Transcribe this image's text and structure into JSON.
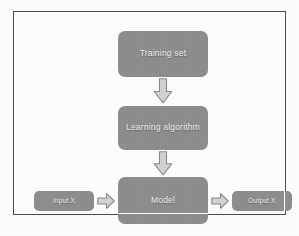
{
  "diagram": {
    "colors": {
      "node_fill": "#8e8e8e",
      "node_text": "#f2f2f2",
      "arrow_fill": "#d4d4d4",
      "arrow_stroke": "#8a8a8a",
      "frame_border": "#4a4a52",
      "page_background": "#ffffff"
    },
    "nodes": [
      {
        "id": "training-set",
        "label": "Training set"
      },
      {
        "id": "learning-algorithm",
        "label": "Learning algorithm"
      },
      {
        "id": "model",
        "label": "Model"
      },
      {
        "id": "input-x",
        "label": "Input X"
      },
      {
        "id": "output-x",
        "label": "Output X"
      }
    ],
    "arrows": [
      {
        "id": "training-to-learning",
        "icon": "arrow-down-icon",
        "from": "training-set",
        "to": "learning-algorithm"
      },
      {
        "id": "learning-to-model",
        "icon": "arrow-down-icon",
        "from": "learning-algorithm",
        "to": "model"
      },
      {
        "id": "input-to-model",
        "icon": "arrow-right-icon",
        "from": "input-x",
        "to": "model"
      },
      {
        "id": "model-to-output",
        "icon": "arrow-right-icon",
        "from": "model",
        "to": "output-x"
      }
    ]
  }
}
